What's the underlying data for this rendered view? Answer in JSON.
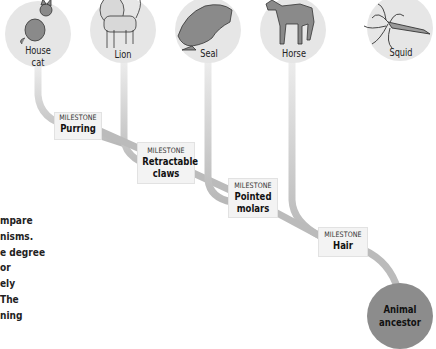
{
  "leaves": [
    {
      "name": "House cat",
      "line1": "House",
      "line2": "cat",
      "icon": "cat-illustration"
    },
    {
      "name": "Lion",
      "line1": "Lion",
      "icon": "lion-illustration"
    },
    {
      "name": "Seal",
      "line1": "Seal",
      "icon": "seal-illustration"
    },
    {
      "name": "Horse",
      "line1": "Horse",
      "icon": "horse-illustration"
    },
    {
      "name": "Squid",
      "line1": "Squid",
      "icon": "squid-illustration"
    }
  ],
  "milestones": [
    {
      "kicker": "MILESTONE",
      "title": "Purring"
    },
    {
      "kicker": "MILESTONE",
      "title": "Retractable",
      "title2": "claws"
    },
    {
      "kicker": "MILESTONE",
      "title": "Pointed",
      "title2": "molars"
    },
    {
      "kicker": "MILESTONE",
      "title": "Hair"
    }
  ],
  "root": {
    "line1": "Animal",
    "line2": "ancestor"
  },
  "side_text": [
    "mpare",
    "nisms.",
    "e degree",
    "or",
    "ely",
    "The",
    "ning"
  ],
  "colors": {
    "leaf_circle": "#e6e6e6",
    "branch": "#bdbdbd",
    "root_circle": "#8c8c8c",
    "milestone_bg": "#f3f3f3"
  }
}
